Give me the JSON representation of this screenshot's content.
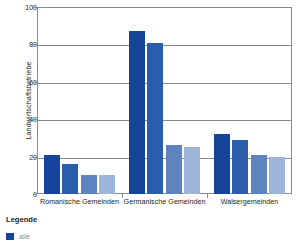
{
  "chart_data": {
    "type": "bar",
    "title": "",
    "subtitle": "",
    "xlabel": "",
    "ylabel": "Landwirtschaftsbetriebe",
    "ylim": [
      0,
      100
    ],
    "yticks": [
      0,
      20,
      40,
      60,
      80,
      100
    ],
    "ytick_labels": [
      "0",
      "20",
      "40",
      "60",
      "80",
      "100"
    ],
    "grid": true,
    "legend_position": "below-left",
    "categories": [
      "Romanische Gemeinden",
      "Germanische Gemeinden",
      "Walsergemeinden"
    ],
    "series": [
      {
        "name": "serie-1",
        "color": "#15459A",
        "values": [
          21,
          87,
          32
        ]
      },
      {
        "name": "serie-2",
        "color": "#2A5DAA",
        "values": [
          16,
          81,
          29
        ]
      },
      {
        "name": "serie-3",
        "color": "#5D84BE",
        "values": [
          10,
          26,
          21
        ]
      },
      {
        "name": "serie-4",
        "color": "#9DB5D9",
        "values": [
          10,
          25,
          20
        ]
      }
    ]
  },
  "axis": {
    "y_title": "Landwirtschaftsbetriebe",
    "ticks": [
      {
        "label": "100",
        "value": 100
      },
      {
        "label": "80",
        "value": 80
      },
      {
        "label": "60",
        "value": 60
      },
      {
        "label": "40",
        "value": 40
      },
      {
        "label": "20",
        "value": 20
      },
      {
        "label": "0",
        "value": 0
      }
    ]
  },
  "categories": [
    {
      "label": "Romanische Gemeinden"
    },
    {
      "label": "Germanische Gemeinden"
    },
    {
      "label": "Walsergemeinden"
    }
  ],
  "legend": {
    "title": "Legende",
    "items": [
      {
        "label": "alle",
        "color": "#15459A"
      }
    ]
  },
  "colors": {
    "series_1": "#15459A",
    "series_2": "#2A5DAA",
    "series_3": "#5D84BE",
    "series_4": "#9DB5D9",
    "axis": "#8A8A8A",
    "text": "#231F20",
    "background": "#FFFFFF"
  }
}
